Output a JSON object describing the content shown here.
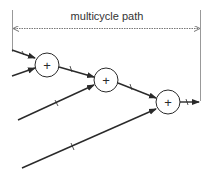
{
  "diagram": {
    "title_label": "multicycle path",
    "adders": [
      {
        "symbol": "+"
      },
      {
        "symbol": "+"
      },
      {
        "symbol": "+"
      }
    ],
    "colors": {
      "line": "#2a2a2a",
      "dashed": "#888888",
      "text": "#333333"
    }
  }
}
